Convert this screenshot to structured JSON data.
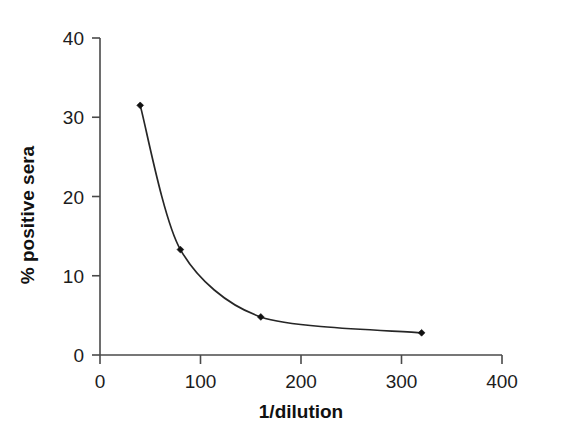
{
  "chart_data": {
    "type": "line",
    "title": "",
    "subtitle": "",
    "xlabel": "1/dilution",
    "ylabel": "% positive sera",
    "xlim": [
      0,
      400
    ],
    "ylim": [
      0,
      40
    ],
    "xticks": [
      0,
      100,
      200,
      300,
      400
    ],
    "xtick_labels": [
      "0",
      "100",
      "200",
      "300",
      "400"
    ],
    "yticks": [
      0,
      10,
      20,
      30,
      40
    ],
    "ytick_labels": [
      "0",
      "10",
      "20",
      "30",
      "40"
    ],
    "grid": false,
    "legend": false,
    "legend_position": "none",
    "marker": "filled-diamond",
    "line_color": "#262626",
    "marker_color": "#111111",
    "axis_color": "#4a4a4a",
    "background_color": "#ffffff",
    "x": [
      40,
      80,
      160,
      320
    ],
    "y": [
      31.5,
      13.3,
      4.8,
      2.8
    ],
    "series": [
      {
        "name": "% positive sera",
        "x": [
          40,
          80,
          160,
          320
        ],
        "values": [
          31.5,
          13.3,
          4.8,
          2.8
        ]
      }
    ],
    "points": [
      {
        "x": 40,
        "y": 31.5
      },
      {
        "x": 80,
        "y": 13.3
      },
      {
        "x": 160,
        "y": 4.8
      },
      {
        "x": 320,
        "y": 2.8
      }
    ],
    "annotations": []
  },
  "axes": {
    "x_axis_name": "x-axis",
    "y_axis_name": "y-axis"
  }
}
